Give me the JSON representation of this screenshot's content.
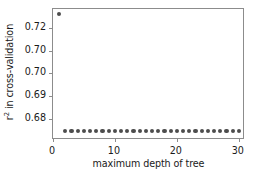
{
  "chart_data": {
    "type": "scatter",
    "title": "",
    "xlabel": "maximum depth of tree",
    "ylabel": "r2 in cross-validation",
    "ylabel_base": "r",
    "ylabel_sup": "2",
    "ylabel_rest": " in cross-validation",
    "xlim": [
      0,
      31
    ],
    "ylim": [
      0.6705,
      0.7285
    ],
    "grid": false,
    "legend": null,
    "xticks": [
      0,
      10,
      20,
      30
    ],
    "xticklabels": [
      "0",
      "10",
      "20",
      "30"
    ],
    "yticks": [
      0.72,
      0.71,
      0.7,
      0.69,
      0.68
    ],
    "yticklabels": [
      "0.72",
      "0.70",
      "0.70",
      "0.69",
      "0.68"
    ],
    "marker": {
      "shape": "circle",
      "color": "#4d4d4d",
      "size_px": 4.2
    },
    "series": [
      {
        "name": "r2 in cross-validation",
        "x": [
          1,
          2,
          3,
          4,
          5,
          6,
          7,
          8,
          9,
          10,
          11,
          12,
          13,
          14,
          15,
          16,
          17,
          18,
          19,
          20,
          21,
          22,
          23,
          24,
          25,
          26,
          27,
          28,
          29,
          30
        ],
        "y": [
          0.7262,
          0.6746,
          0.6745,
          0.6745,
          0.6745,
          0.6745,
          0.6745,
          0.6745,
          0.6745,
          0.6745,
          0.6745,
          0.6745,
          0.6745,
          0.6745,
          0.6745,
          0.6745,
          0.6745,
          0.6745,
          0.6745,
          0.6745,
          0.6745,
          0.6745,
          0.6745,
          0.6745,
          0.6745,
          0.6745,
          0.6745,
          0.6745,
          0.6745,
          0.6745
        ]
      }
    ],
    "annotations": []
  },
  "style": {
    "background": "#ffffff",
    "frame_color": "#8c8c8c",
    "text_color": "#1a1a1a",
    "marker_color": "#4d4d4d"
  }
}
